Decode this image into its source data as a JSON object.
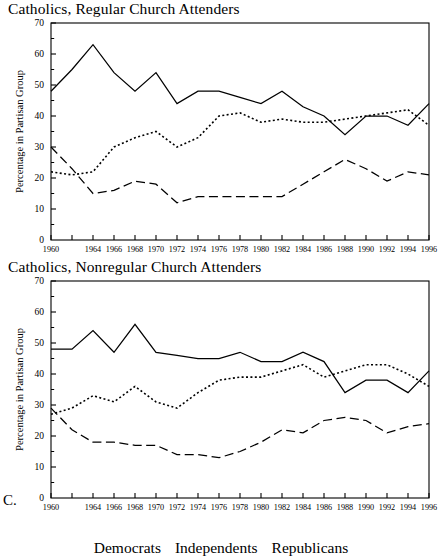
{
  "figure": {
    "panel_letter": "C.",
    "legend": {
      "democrats": "Democrats",
      "independents": "Independents",
      "republicans": "Republicans"
    }
  },
  "chart_data": [
    {
      "type": "line",
      "title": "Catholics, Regular Church Attenders",
      "xlabel": "",
      "ylabel": "Percentage in Partisan Group",
      "ylim": [
        0,
        70
      ],
      "ytick_labels": [
        "0",
        "10",
        "20",
        "30",
        "40",
        "50",
        "60",
        "70"
      ],
      "ytick_values": [
        0,
        10,
        20,
        30,
        40,
        50,
        60,
        70
      ],
      "yminor_step": 5,
      "grid": false,
      "legend_position": "below-figure",
      "x": [
        1960,
        1962,
        1964,
        1966,
        1968,
        1970,
        1972,
        1974,
        1976,
        1978,
        1980,
        1982,
        1984,
        1986,
        1988,
        1990,
        1992,
        1994,
        1996
      ],
      "xtick_labels": [
        "1960",
        "1964",
        "1966",
        "1968",
        "1970",
        "1972",
        "1974",
        "1976",
        "1978",
        "1980",
        "1982",
        "1984",
        "1986",
        "1988",
        "1990",
        "1992",
        "1994",
        "1996"
      ],
      "xtick_label_years": [
        1960,
        1964,
        1966,
        1968,
        1970,
        1972,
        1974,
        1976,
        1978,
        1980,
        1982,
        1984,
        1986,
        1988,
        1990,
        1992,
        1994,
        1996
      ],
      "series": [
        {
          "name": "Democrats",
          "style": "solid",
          "values": [
            48,
            55,
            63,
            54,
            48,
            54,
            44,
            48,
            48,
            46,
            44,
            48,
            43,
            40,
            34,
            40,
            40,
            37,
            44
          ]
        },
        {
          "name": "Independents",
          "style": "dotted",
          "values": [
            22,
            21,
            22,
            30,
            33,
            35,
            30,
            33,
            40,
            41,
            38,
            39,
            38,
            38,
            39,
            40,
            41,
            42,
            37
          ]
        },
        {
          "name": "Republicans",
          "style": "dashed",
          "values": [
            30,
            23,
            15,
            16,
            19,
            18,
            12,
            14,
            14,
            14,
            14,
            14,
            18,
            22,
            26,
            23,
            19,
            22,
            21
          ]
        }
      ]
    },
    {
      "type": "line",
      "title": "Catholics, Nonregular Church Attenders",
      "xlabel": "",
      "ylabel": "Percentage in Partisan Group",
      "ylim": [
        0,
        70
      ],
      "ytick_labels": [
        "0",
        "10",
        "20",
        "30",
        "40",
        "50",
        "60",
        "70"
      ],
      "ytick_values": [
        0,
        10,
        20,
        30,
        40,
        50,
        60,
        70
      ],
      "yminor_step": 5,
      "grid": false,
      "legend_position": "below-figure",
      "x": [
        1960,
        1962,
        1964,
        1966,
        1968,
        1970,
        1972,
        1974,
        1976,
        1978,
        1980,
        1982,
        1984,
        1986,
        1988,
        1990,
        1992,
        1994,
        1996
      ],
      "xtick_labels": [
        "1960",
        "1964",
        "1966",
        "1968",
        "1970",
        "1972",
        "1974",
        "1976",
        "1978",
        "1980",
        "1982",
        "1984",
        "1986",
        "1988",
        "1990",
        "1992",
        "1994",
        "1996"
      ],
      "xtick_label_years": [
        1960,
        1964,
        1966,
        1968,
        1970,
        1972,
        1974,
        1976,
        1978,
        1980,
        1982,
        1984,
        1986,
        1988,
        1990,
        1992,
        1994,
        1996
      ],
      "series": [
        {
          "name": "Democrats",
          "style": "solid",
          "values": [
            48,
            48,
            54,
            47,
            56,
            47,
            46,
            45,
            45,
            47,
            44,
            44,
            47,
            44,
            34,
            38,
            38,
            34,
            41
          ]
        },
        {
          "name": "Independents",
          "style": "dotted",
          "values": [
            27,
            29,
            33,
            31,
            36,
            31,
            29,
            34,
            38,
            39,
            39,
            41,
            43,
            39,
            41,
            43,
            43,
            40,
            36
          ]
        },
        {
          "name": "Republicans",
          "style": "dashed",
          "values": [
            29,
            22,
            18,
            18,
            17,
            17,
            14,
            14,
            13,
            15,
            18,
            22,
            21,
            25,
            26,
            25,
            21,
            23,
            24
          ]
        }
      ]
    }
  ]
}
